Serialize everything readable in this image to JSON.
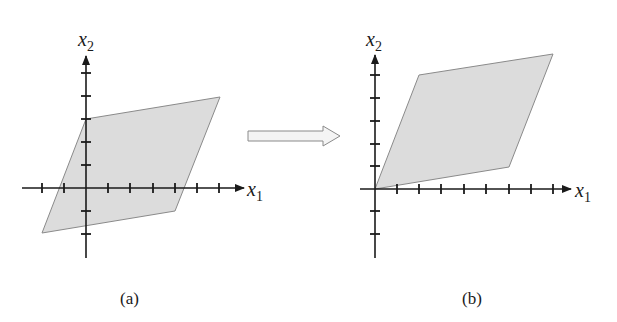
{
  "panels": [
    {
      "id": "a",
      "caption": "(a)",
      "x_axis_label": "x",
      "x_axis_sub": "1",
      "y_axis_label": "x",
      "y_axis_sub": "2",
      "fill_color": "#dcdcdc"
    },
    {
      "id": "b",
      "caption": "(b)",
      "x_axis_label": "x",
      "x_axis_sub": "1",
      "y_axis_label": "x",
      "y_axis_sub": "2",
      "fill_color": "#dcdcdc"
    }
  ],
  "transform_arrow": {
    "direction": "right"
  }
}
